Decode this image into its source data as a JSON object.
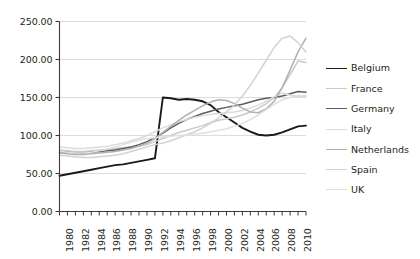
{
  "chart_data": {
    "type": "line",
    "title": "",
    "subtitle": "",
    "xlabel": "",
    "ylabel": "",
    "xlim": [
      1980,
      2011
    ],
    "ylim": [
      0,
      250
    ],
    "grid": true,
    "grid_axis": "y",
    "legend_position": "right",
    "y_ticks": [
      0,
      50,
      100,
      150,
      200,
      250
    ],
    "y_tick_labels": [
      "0.00",
      "50.00",
      "100.00",
      "150.00",
      "200.00",
      "250.00"
    ],
    "x_ticks": [
      1980,
      1982,
      1984,
      1986,
      1988,
      1990,
      1992,
      1994,
      1996,
      1998,
      2000,
      2002,
      2004,
      2006,
      2008,
      2010
    ],
    "x_tick_labels": [
      "1980",
      "1982",
      "1984",
      "1986",
      "1988",
      "1990",
      "1992",
      "1994",
      "1996",
      "1998",
      "2000",
      "2002",
      "2004",
      "2006",
      "2008",
      "2010"
    ],
    "x_minor_ticks": [
      1981,
      1983,
      1985,
      1987,
      1989,
      1991,
      1993,
      1995,
      1997,
      1999,
      2001,
      2003,
      2005,
      2007,
      2009,
      2011
    ],
    "x": [
      1980,
      1981,
      1982,
      1983,
      1984,
      1985,
      1986,
      1987,
      1988,
      1989,
      1990,
      1991,
      1992,
      1993,
      1994,
      1995,
      1996,
      1997,
      1998,
      1999,
      2000,
      2001,
      2002,
      2003,
      2004,
      2005,
      2006,
      2007,
      2008,
      2009,
      2010,
      2011
    ],
    "series": [
      {
        "name": "Belgium",
        "color": "#1a1a1a",
        "width": 1.9,
        "values": [
          47,
          49,
          51,
          53,
          55,
          57,
          59,
          61,
          62,
          64,
          66,
          68,
          70,
          150,
          149,
          147,
          148,
          147,
          145,
          140,
          131,
          124,
          117,
          110,
          105,
          101,
          100,
          101,
          104,
          108,
          112,
          113
        ]
      },
      {
        "name": "France",
        "color": "#c9c9c9",
        "width": 1.5,
        "values": [
          81,
          80,
          79,
          79,
          80,
          81,
          82,
          83,
          84,
          85,
          86,
          88,
          92,
          96,
          100,
          104,
          107,
          110,
          113,
          117,
          120,
          122,
          124,
          127,
          131,
          136,
          142,
          150,
          163,
          180,
          198,
          196
        ]
      },
      {
        "name": "Germany",
        "color": "#5c5c5c",
        "width": 1.5,
        "values": [
          78,
          78,
          77,
          77,
          78,
          79,
          80,
          81,
          83,
          85,
          88,
          92,
          97,
          103,
          110,
          116,
          121,
          125,
          129,
          132,
          135,
          137,
          139,
          141,
          144,
          147,
          149,
          150,
          152,
          155,
          158,
          157
        ]
      },
      {
        "name": "Italy",
        "color": "#dcdcdc",
        "width": 1.5,
        "values": [
          85,
          84,
          83,
          83,
          84,
          85,
          86,
          88,
          90,
          93,
          96,
          100,
          105,
          110,
          114,
          118,
          121,
          124,
          126,
          128,
          129,
          130,
          131,
          133,
          136,
          140,
          145,
          151,
          156,
          153,
          152,
          151
        ]
      },
      {
        "name": "Netherlands",
        "color": "#b0b0b0",
        "width": 1.5,
        "values": [
          77,
          76,
          75,
          75,
          76,
          77,
          78,
          79,
          81,
          83,
          86,
          90,
          96,
          104,
          112,
          120,
          127,
          133,
          139,
          144,
          147,
          146,
          142,
          136,
          131,
          130,
          135,
          145,
          163,
          186,
          210,
          228
        ]
      },
      {
        "name": "Spain",
        "color": "#d2d2d2",
        "width": 1.5,
        "values": [
          74,
          73,
          72,
          71,
          71,
          72,
          73,
          74,
          76,
          79,
          82,
          85,
          88,
          90,
          93,
          97,
          101,
          105,
          110,
          116,
          123,
          131,
          140,
          152,
          166,
          182,
          199,
          216,
          228,
          231,
          222,
          210
        ]
      },
      {
        "name": "UK",
        "color": "#e0e0e0",
        "width": 1.5,
        "values": [
          79,
          78,
          77,
          77,
          78,
          80,
          82,
          85,
          88,
          91,
          94,
          96,
          97,
          98,
          99,
          100,
          101,
          102,
          103,
          105,
          107,
          109,
          112,
          116,
          121,
          127,
          134,
          141,
          147,
          150,
          152,
          153
        ]
      }
    ]
  },
  "legend": {
    "items": [
      {
        "label": "Belgium"
      },
      {
        "label": "France"
      },
      {
        "label": "Germany"
      },
      {
        "label": "Italy"
      },
      {
        "label": "Netherlands"
      },
      {
        "label": "Spain"
      },
      {
        "label": "UK"
      }
    ]
  }
}
